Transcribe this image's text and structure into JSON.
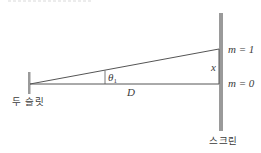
{
  "diagram": {
    "type": "double-slit geometry",
    "labels": {
      "slits": "두 슬릿",
      "screen": "스크린",
      "distance": "D",
      "angle_symbol": "θ",
      "angle_subscript": "1",
      "offset": "x",
      "order_1": "m = 1",
      "order_0": "m = 0"
    },
    "colors": {
      "line": "#555555",
      "barrier": "#9a9a9a",
      "text": "#3a3a3a"
    }
  }
}
